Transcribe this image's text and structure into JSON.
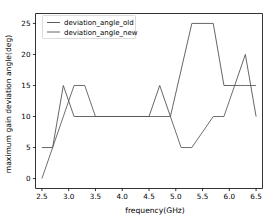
{
  "chart_data": {
    "type": "line",
    "title": "",
    "xlabel": "frequency(GHz)",
    "ylabel": "maximum gain deviation angle(deg)",
    "xlim": [
      2.38,
      6.62
    ],
    "ylim": [
      -1.6,
      26.6
    ],
    "xticks": [
      2.5,
      3.0,
      3.5,
      4.0,
      4.5,
      5.0,
      5.5,
      6.0,
      6.5
    ],
    "xticklabels": [
      "2.5",
      "3.0",
      "3.5",
      "4.0",
      "4.5",
      "5.0",
      "5.5",
      "6.0",
      "6.5"
    ],
    "yticks": [
      0,
      5,
      10,
      15,
      20,
      25
    ],
    "yticklabels": [
      "0",
      "5",
      "10",
      "15",
      "20",
      "25"
    ],
    "grid": false,
    "legend_position": "upper left",
    "series": [
      {
        "name": "deviation_angle_old",
        "color": "#4a4a4a",
        "x": [
          2.5,
          2.7,
          2.9,
          3.1,
          4.5,
          4.7,
          4.9,
          5.3,
          5.7,
          5.9,
          6.1,
          6.3,
          6.5
        ],
        "values": [
          5,
          5,
          15,
          10,
          10,
          15,
          10,
          25,
          25,
          15,
          15,
          20,
          10
        ]
      },
      {
        "name": "deviation_angle_new",
        "color": "#555555",
        "x": [
          2.5,
          3.1,
          3.3,
          3.5,
          4.9,
          5.1,
          5.3,
          5.7,
          5.9,
          6.1,
          6.3,
          6.5
        ],
        "values": [
          0,
          15,
          15,
          10,
          10,
          5,
          5,
          10,
          10,
          15,
          15,
          15
        ]
      }
    ]
  },
  "legend": {
    "entries": [
      {
        "label": "deviation_angle_old"
      },
      {
        "label": "deviation_angle_new"
      }
    ]
  },
  "axes": {
    "xlabel": "frequency(GHz)",
    "ylabel": "maximum gain deviation angle(deg)"
  }
}
